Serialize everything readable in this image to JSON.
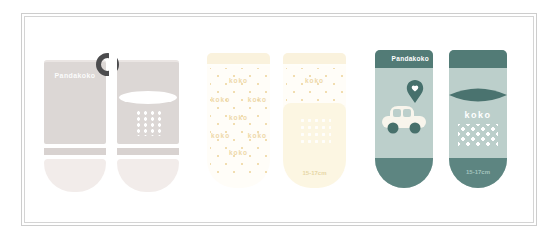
{
  "image_type": "product-photo of three pairs of baby socks",
  "brand": "Pandakoko",
  "frame": {
    "style": "double-line",
    "color": "#cdcdcd"
  },
  "pairs": {
    "pink": {
      "colorway": "pale pink",
      "brand_label": "Pandakoko",
      "body_color": "#dcd7d5",
      "stripe_color": "#d8d2d0",
      "toe_color": "#f2ecea",
      "pattern_color": "#ffffff",
      "clip_color": "#4c4c4e"
    },
    "yellow": {
      "colorway": "white and yellow",
      "pattern_word": "koko",
      "size_label": "15-17cm",
      "cuff_color": "#faf2dd",
      "body_color": "#fffdf8",
      "pattern_color": "#eed8a8",
      "foot_color": "#fcf6e2",
      "size_text_color": "#e7d6a6"
    },
    "teal": {
      "colorway": "teal",
      "brand_label": "Pandakoko",
      "logo_word": "koko",
      "size_label": "15-17cm",
      "band_color": "#527b76",
      "body_color": "#bccfcb",
      "accent_color": "#46706c",
      "toe_color": "#5d8581",
      "car_color": "#f8f5ec",
      "size_text_color": "#a3c4be"
    }
  },
  "icons": {
    "hanger_clip": "ring-clip",
    "location_pin": "map-pin-with-heart",
    "car": "toy-car",
    "lens": "lens-ellipse"
  }
}
